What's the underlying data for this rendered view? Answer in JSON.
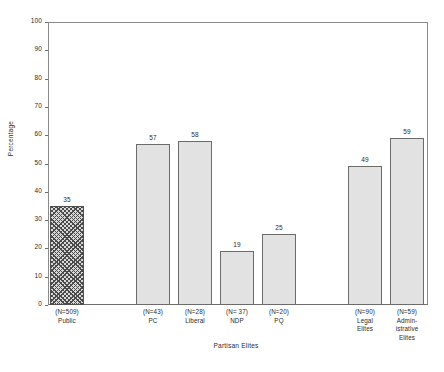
{
  "chart_data": {
    "type": "bar",
    "title": "",
    "xlabel": "Partisan Elites",
    "ylabel": "Percentage",
    "ylim": [
      0,
      100
    ],
    "ytick_values": [
      0,
      10,
      20,
      30,
      40,
      50,
      60,
      70,
      80,
      90,
      100
    ],
    "ytick_labels": [
      "0",
      "10",
      "20",
      "30",
      "40",
      "50",
      "60",
      "70",
      "80",
      "90",
      "100"
    ],
    "grid": false,
    "legend": "none",
    "categories": [
      "(N=509)\nPublic",
      "(N=43)\nPC",
      "(N=28)\nLiberal",
      "(N= 37)\nNDP",
      "(N=20)\nPQ",
      "(N=90)\nLegal\nElites",
      "(N=59)\nAdmin-\nistrative\nElites"
    ],
    "values": [
      35,
      57,
      58,
      19,
      25,
      49,
      59
    ],
    "value_labels": [
      "35",
      "57",
      "58",
      "19",
      "25",
      "49",
      "59"
    ],
    "bar_styles": [
      "hatched",
      "solid",
      "solid",
      "solid",
      "solid",
      "solid",
      "solid"
    ],
    "bar_geometry": [
      {
        "left": 50,
        "width": 34
      },
      {
        "left": 136,
        "width": 34
      },
      {
        "left": 178,
        "width": 34
      },
      {
        "left": 220,
        "width": 34
      },
      {
        "left": 262,
        "width": 34
      },
      {
        "left": 348,
        "width": 34
      },
      {
        "left": 390,
        "width": 34
      }
    ],
    "colors": {
      "bar_fill": "#e2e2e2",
      "bar_border": "#6b6b6b",
      "hatch_fill": "#d9d9d9",
      "hatch_line": "#4a4a4a",
      "axis": "#6e6e6e",
      "text": "#2b2b2b",
      "background": "#ffffff"
    }
  }
}
